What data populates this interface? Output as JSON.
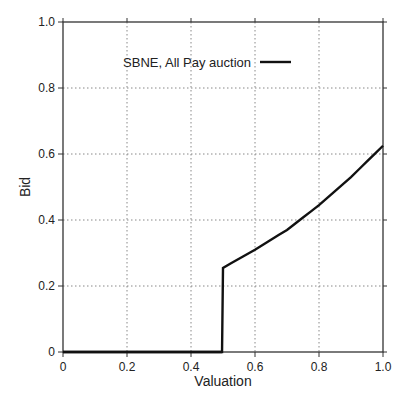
{
  "chart_data": {
    "type": "line",
    "title": "",
    "xlabel": "Valuation",
    "ylabel": "Bid",
    "xlim": [
      0,
      1.0
    ],
    "ylim": [
      0,
      1.0
    ],
    "grid": true,
    "legend_position": "upper center",
    "x_ticks": [
      "0",
      "0.2",
      "0.4",
      "0.6",
      "0.8",
      "1.0"
    ],
    "y_ticks": [
      "0",
      "0.2",
      "0.4",
      "0.6",
      "0.8",
      "1.0"
    ],
    "series": [
      {
        "name": "SBNE, All Pay auction",
        "color": "#111111",
        "x": [
          0,
          0.1,
          0.2,
          0.3,
          0.4,
          0.497,
          0.5,
          0.6,
          0.7,
          0.8,
          0.9,
          1.0
        ],
        "y": [
          0,
          0,
          0,
          0,
          0,
          0,
          0.255,
          0.31,
          0.37,
          0.445,
          0.53,
          0.625
        ]
      }
    ]
  }
}
